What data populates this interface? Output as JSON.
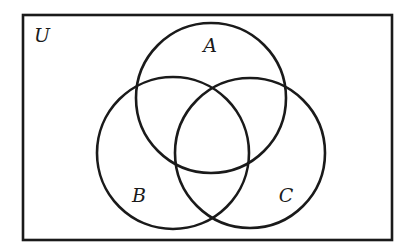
{
  "diagram": {
    "type": "venn",
    "universe": {
      "label": "U",
      "rect": {
        "x": 23,
        "y": 15,
        "width": 369,
        "height": 225
      },
      "label_pos": {
        "x": 42,
        "y": 42
      }
    },
    "sets": [
      {
        "id": "A",
        "label": "A",
        "cx": 211,
        "cy": 98,
        "r": 75,
        "label_pos": {
          "x": 210,
          "y": 52
        }
      },
      {
        "id": "B",
        "label": "B",
        "cx": 173,
        "cy": 153,
        "r": 76,
        "label_pos": {
          "x": 139,
          "y": 202
        }
      },
      {
        "id": "C",
        "label": "C",
        "cx": 250,
        "cy": 153,
        "r": 75,
        "label_pos": {
          "x": 286,
          "y": 202
        }
      }
    ],
    "stroke_color": "#1a1a1a",
    "background_color": "#ffffff"
  }
}
